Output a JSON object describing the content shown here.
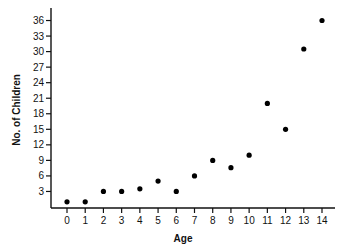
{
  "chart_data": {
    "type": "scatter",
    "title": "",
    "xlabel": "Age",
    "ylabel": "No. of Children",
    "x": [
      0,
      1,
      2,
      3,
      4,
      5,
      6,
      7,
      8,
      9,
      10,
      11,
      12,
      13,
      14
    ],
    "y": [
      1,
      1,
      3,
      3,
      3.5,
      5,
      3,
      6,
      9,
      7.6,
      10,
      20,
      15,
      30.5,
      36
    ],
    "xticks": [
      "0",
      "1",
      "2",
      "3",
      "4",
      "5",
      "6",
      "7",
      "8",
      "9",
      "10",
      "11",
      "12",
      "13",
      "14"
    ],
    "yticks": [
      "3",
      "6",
      "9",
      "12",
      "15",
      "18",
      "21",
      "24",
      "27",
      "30",
      "33",
      "36"
    ],
    "xlim": [
      -0.5,
      14.5
    ],
    "ylim": [
      0,
      38
    ],
    "grid": false,
    "legend": null,
    "marker_color": "#000000"
  }
}
